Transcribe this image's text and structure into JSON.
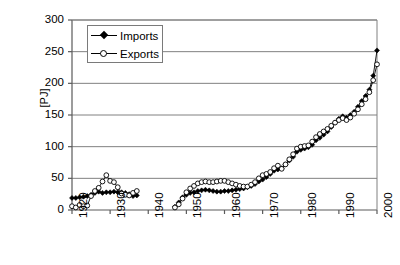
{
  "chart_data": {
    "type": "line",
    "title": "",
    "xlabel": "",
    "ylabel": "[PJ]",
    "xlim": [
      1920,
      2000
    ],
    "ylim": [
      0,
      300
    ],
    "ytick_labels": [
      "0",
      "50",
      "100",
      "150",
      "200",
      "250",
      "300"
    ],
    "yticks": [
      0,
      50,
      100,
      150,
      200,
      250,
      300
    ],
    "xtick_labels": [
      "1920",
      "1930",
      "1940",
      "1950",
      "1960",
      "1970",
      "1980",
      "1990",
      "2000"
    ],
    "xticks": [
      1920,
      1930,
      1940,
      1950,
      1960,
      1970,
      1980,
      1990,
      2000
    ],
    "grid": "horizontal",
    "legend_position": "top-left-inside",
    "legend": [
      {
        "name": "Imports",
        "marker": "filled-diamond",
        "color": "#000000"
      },
      {
        "name": "Exports",
        "marker": "open-circle",
        "color": "#000000"
      }
    ],
    "series": [
      {
        "name": "Imports",
        "marker": "filled-diamond",
        "color": "#000000",
        "points": [
          [
            1920,
            19
          ],
          [
            1921,
            19
          ],
          [
            1922,
            20
          ],
          [
            1923,
            21
          ],
          [
            1924,
            22
          ],
          [
            1925,
            24
          ],
          [
            1926,
            27
          ],
          [
            1927,
            29
          ],
          [
            1928,
            27
          ],
          [
            1929,
            28
          ],
          [
            1930,
            28
          ],
          [
            1931,
            29
          ],
          [
            1932,
            28
          ],
          [
            1933,
            28
          ],
          [
            1934,
            27
          ],
          [
            1935,
            25
          ],
          [
            1936,
            22
          ],
          [
            1937,
            23
          ],
          [
            1947,
            5
          ],
          [
            1948,
            12
          ],
          [
            1949,
            20
          ],
          [
            1950,
            24
          ],
          [
            1951,
            27
          ],
          [
            1952,
            28
          ],
          [
            1953,
            30
          ],
          [
            1954,
            31
          ],
          [
            1955,
            32
          ],
          [
            1956,
            31
          ],
          [
            1957,
            30
          ],
          [
            1958,
            29
          ],
          [
            1959,
            29
          ],
          [
            1960,
            30
          ],
          [
            1961,
            30
          ],
          [
            1962,
            31
          ],
          [
            1963,
            32
          ],
          [
            1964,
            33
          ],
          [
            1965,
            34
          ],
          [
            1966,
            36
          ],
          [
            1967,
            38
          ],
          [
            1968,
            41
          ],
          [
            1969,
            45
          ],
          [
            1970,
            48
          ],
          [
            1971,
            52
          ],
          [
            1972,
            57
          ],
          [
            1973,
            62
          ],
          [
            1974,
            64
          ],
          [
            1975,
            66
          ],
          [
            1976,
            72
          ],
          [
            1977,
            78
          ],
          [
            1978,
            84
          ],
          [
            1979,
            92
          ],
          [
            1980,
            95
          ],
          [
            1981,
            97
          ],
          [
            1982,
            99
          ],
          [
            1983,
            103
          ],
          [
            1984,
            110
          ],
          [
            1985,
            114
          ],
          [
            1986,
            119
          ],
          [
            1987,
            124
          ],
          [
            1988,
            131
          ],
          [
            1989,
            138
          ],
          [
            1990,
            144
          ],
          [
            1991,
            148
          ],
          [
            1992,
            146
          ],
          [
            1993,
            150
          ],
          [
            1994,
            155
          ],
          [
            1995,
            163
          ],
          [
            1996,
            172
          ],
          [
            1997,
            180
          ],
          [
            1998,
            190
          ],
          [
            1999,
            212
          ],
          [
            2000,
            252
          ]
        ]
      },
      {
        "name": "Exports",
        "marker": "open-circle",
        "color": "#000000",
        "points": [
          [
            1920,
            6
          ],
          [
            1921,
            4
          ],
          [
            1922,
            8
          ],
          [
            1923,
            6
          ],
          [
            1924,
            7
          ],
          [
            1925,
            22
          ],
          [
            1926,
            30
          ],
          [
            1927,
            35
          ],
          [
            1928,
            45
          ],
          [
            1929,
            55
          ],
          [
            1930,
            46
          ],
          [
            1931,
            44
          ],
          [
            1932,
            36
          ],
          [
            1933,
            26
          ],
          [
            1934,
            24
          ],
          [
            1935,
            23
          ],
          [
            1936,
            27
          ],
          [
            1937,
            30
          ],
          [
            1947,
            4
          ],
          [
            1948,
            9
          ],
          [
            1949,
            18
          ],
          [
            1950,
            28
          ],
          [
            1951,
            34
          ],
          [
            1952,
            38
          ],
          [
            1953,
            42
          ],
          [
            1954,
            44
          ],
          [
            1955,
            45
          ],
          [
            1956,
            44
          ],
          [
            1957,
            44
          ],
          [
            1958,
            45
          ],
          [
            1959,
            46
          ],
          [
            1960,
            46
          ],
          [
            1961,
            44
          ],
          [
            1962,
            42
          ],
          [
            1963,
            40
          ],
          [
            1964,
            38
          ],
          [
            1965,
            37
          ],
          [
            1966,
            37
          ],
          [
            1967,
            40
          ],
          [
            1968,
            44
          ],
          [
            1969,
            50
          ],
          [
            1970,
            55
          ],
          [
            1971,
            57
          ],
          [
            1972,
            60
          ],
          [
            1973,
            66
          ],
          [
            1974,
            70
          ],
          [
            1975,
            65
          ],
          [
            1976,
            72
          ],
          [
            1977,
            80
          ],
          [
            1978,
            88
          ],
          [
            1979,
            97
          ],
          [
            1980,
            100
          ],
          [
            1981,
            101
          ],
          [
            1982,
            102
          ],
          [
            1983,
            108
          ],
          [
            1984,
            115
          ],
          [
            1985,
            120
          ],
          [
            1986,
            124
          ],
          [
            1987,
            128
          ],
          [
            1988,
            133
          ],
          [
            1989,
            138
          ],
          [
            1990,
            142
          ],
          [
            1991,
            145
          ],
          [
            1992,
            142
          ],
          [
            1993,
            146
          ],
          [
            1994,
            152
          ],
          [
            1995,
            159
          ],
          [
            1996,
            167
          ],
          [
            1997,
            175
          ],
          [
            1998,
            186
          ],
          [
            1999,
            205
          ],
          [
            2000,
            230
          ]
        ]
      }
    ]
  }
}
